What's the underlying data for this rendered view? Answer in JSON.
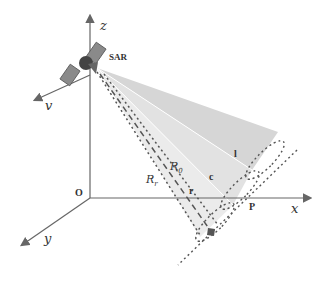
{
  "diagram": {
    "axes": {
      "z_label": "z",
      "x_label": "x",
      "y_label": "y",
      "v_label": "v",
      "origin_label": "O"
    },
    "platform_label": "SAR",
    "beam_labels": {
      "l": "l",
      "c": "c",
      "r": "r"
    },
    "range_labels": {
      "R0": "R",
      "R0_sub": "0",
      "Rr": "R",
      "Rr_sub": "r"
    },
    "point_label": "P",
    "colors": {
      "axis": "#666666",
      "beam_far": "#d6d6d6",
      "beam_mid": "#e2e2e2",
      "beam_near": "#ebebeb",
      "dash": "#555555",
      "satellite_body": "#444444",
      "solar_panel": "#8a8a8a"
    }
  }
}
